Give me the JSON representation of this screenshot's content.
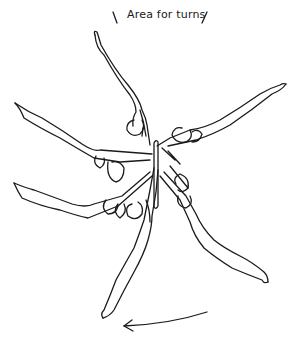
{
  "diagram": {
    "title": "Area for turns",
    "figure_count": 6,
    "elements": [
      {
        "id": "turn-area-marker-left",
        "type": "tick-mark"
      },
      {
        "id": "turn-area-label",
        "text": "Area for turns"
      },
      {
        "id": "turn-area-marker-right",
        "type": "tick-mark"
      },
      {
        "id": "bar",
        "type": "vertical bar at center"
      },
      {
        "id": "figure-1",
        "orientation": "legs up-left (top)"
      },
      {
        "id": "figure-2",
        "orientation": "legs right (upper-right)"
      },
      {
        "id": "figure-3",
        "orientation": "legs upper-left"
      },
      {
        "id": "figure-4",
        "orientation": "legs left (lower-left)"
      },
      {
        "id": "figure-5",
        "orientation": "legs down (bottom)"
      },
      {
        "id": "figure-6",
        "orientation": "legs lower-right"
      },
      {
        "id": "rotation-arrow",
        "direction": "counter-clockwise (right to left)"
      }
    ],
    "colors": {
      "ink": "#1a1a1a",
      "background": "#ffffff"
    }
  }
}
